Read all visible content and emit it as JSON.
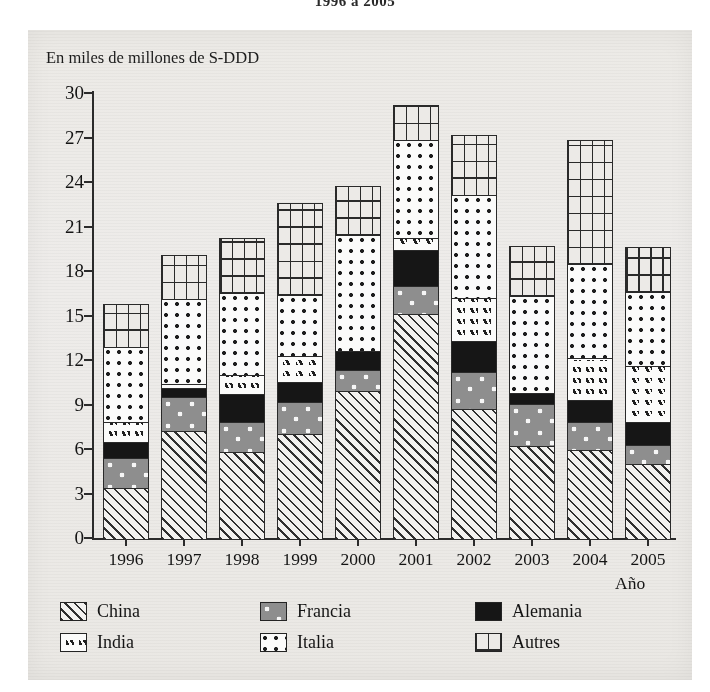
{
  "title": "1996 a 2005",
  "axis_unit_label": "En miles de millones de S-DDD",
  "x_axis_name": "Año",
  "legend": [
    {
      "key": "china",
      "label": "China"
    },
    {
      "key": "francia",
      "label": "Francia"
    },
    {
      "key": "alemania",
      "label": "Alemania"
    },
    {
      "key": "india",
      "label": "India"
    },
    {
      "key": "italia",
      "label": "Italia"
    },
    {
      "key": "autres",
      "label": "Autres"
    }
  ],
  "chart_data": {
    "type": "bar",
    "stacked": true,
    "title": "1996 a 2005",
    "xlabel": "Año",
    "ylabel": "En miles de millones de S-DDD",
    "ylim": [
      0,
      30
    ],
    "yticks": [
      0,
      3,
      6,
      9,
      12,
      15,
      18,
      21,
      24,
      27,
      30
    ],
    "grid": false,
    "legend_position": "bottom",
    "categories": [
      "1996",
      "1997",
      "1998",
      "1999",
      "2000",
      "2001",
      "2002",
      "2003",
      "2004",
      "2005"
    ],
    "series": [
      {
        "name": "China",
        "values": [
          3.4,
          7.2,
          5.8,
          7.0,
          9.9,
          15.1,
          8.7,
          6.2,
          5.9,
          5.0
        ]
      },
      {
        "name": "Francia",
        "values": [
          2.0,
          2.3,
          2.0,
          2.2,
          1.4,
          1.9,
          2.5,
          2.8,
          1.9,
          1.3
        ]
      },
      {
        "name": "Alemania",
        "values": [
          1.1,
          0.6,
          1.9,
          1.3,
          1.3,
          2.4,
          2.1,
          0.8,
          1.5,
          1.5
        ]
      },
      {
        "name": "India",
        "values": [
          1.3,
          0.3,
          1.3,
          1.8,
          0.0,
          0.8,
          2.9,
          0.0,
          2.8,
          3.8
        ]
      },
      {
        "name": "Italia",
        "values": [
          5.1,
          5.7,
          5.5,
          4.1,
          7.8,
          6.6,
          6.9,
          6.5,
          6.4,
          5.0
        ]
      },
      {
        "name": "Autres",
        "values": [
          2.9,
          3.0,
          3.7,
          6.2,
          3.3,
          2.4,
          4.1,
          3.4,
          8.3,
          3.0
        ]
      }
    ],
    "totals": [
      15.8,
      19.1,
      20.2,
      22.6,
      23.7,
      29.2,
      27.2,
      19.7,
      26.8,
      19.6
    ]
  }
}
